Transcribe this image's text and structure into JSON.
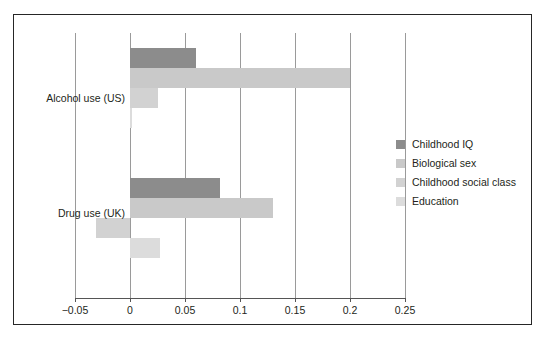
{
  "chart_data": {
    "type": "bar",
    "orientation": "horizontal",
    "title": "",
    "xlabel": "",
    "ylabel": "",
    "categories": [
      "Alcohol use (US)",
      "Drug use (UK)"
    ],
    "series": [
      {
        "name": "Childhood IQ",
        "color": "#8c8c8c",
        "values": [
          0.06,
          0.082
        ]
      },
      {
        "name": "Biological sex",
        "color": "#c9c9c9",
        "values": [
          0.2,
          0.13
        ]
      },
      {
        "name": "Childhood social class",
        "color": "#d2d2d2",
        "values": [
          0.025,
          -0.031
        ]
      },
      {
        "name": "Education",
        "color": "#dcdcdc",
        "values": [
          0.002,
          0.027
        ]
      }
    ],
    "xticks": [
      "−0.05",
      "0",
      "0.05",
      "0.1",
      "0.15",
      "0.2",
      "0.25"
    ],
    "xtick_values": [
      -0.05,
      0,
      0.05,
      0.1,
      0.15,
      0.2,
      0.25
    ],
    "xlim": [
      -0.05,
      0.25
    ],
    "grid": "vertical",
    "legend_position": "right",
    "legend": [
      "Childhood IQ",
      "Biological sex",
      "Childhood social class",
      "Education"
    ]
  }
}
